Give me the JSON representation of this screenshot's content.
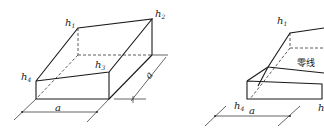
{
  "figure_left": {
    "labels": {
      "h1": {
        "base": "h",
        "sub": "1"
      },
      "h2": {
        "base": "h",
        "sub": "2"
      },
      "h3": {
        "base": "h",
        "sub": "3"
      },
      "h4": {
        "base": "h",
        "sub": "4"
      },
      "width": "a",
      "depth": "a"
    }
  },
  "figure_right": {
    "labels": {
      "h1": {
        "base": "h",
        "sub": "1"
      },
      "h4": {
        "base": "h",
        "sub": "4"
      },
      "h_partial": "h",
      "width": "a",
      "zero_line": "零线"
    }
  },
  "colors": {
    "line": "#1a1a1a",
    "background": "#ffffff"
  }
}
